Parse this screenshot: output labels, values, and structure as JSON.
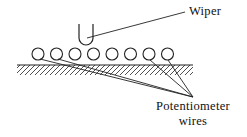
{
  "diagram": {
    "type": "potentiometer-cross-section",
    "labels": {
      "wiper": "Wiper",
      "wires_line1": "Potentiometer",
      "wires_line2": "wires"
    },
    "components": {
      "wiper": {
        "shape": "U-contact",
        "x_left": 79,
        "x_right": 93,
        "y_top": 24,
        "y_bottom": 45
      },
      "wires": {
        "count": 8,
        "radius": 6,
        "center_y": 54,
        "centers_x": [
          38,
          56.5,
          75,
          93.5,
          112,
          130.5,
          149,
          167.5
        ]
      },
      "base": {
        "y": 65,
        "x_start": 17,
        "x_end": 193,
        "hatched": true
      }
    },
    "leader_lines": {
      "wiper": {
        "from": [
          87,
          38
        ],
        "to": [
          185,
          12
        ]
      },
      "wires_target": [
        193,
        97
      ],
      "wires_sources": [
        [
          40,
          59
        ],
        [
          58,
          59
        ],
        [
          150,
          60
        ],
        [
          168,
          60
        ]
      ]
    },
    "colors": {
      "stroke": "#222222",
      "background": "#ffffff"
    }
  }
}
